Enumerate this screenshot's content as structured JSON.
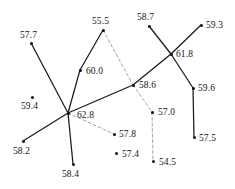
{
  "figure": {
    "type": "node-link-diagram",
    "background_color": "#ffffff",
    "line_color_solid": "#1a1a1a",
    "line_color_dashed": "#9a9a9a",
    "node_color": "#101010",
    "width": 235,
    "height": 189
  },
  "nodes": [
    {
      "id": "n57_7",
      "label": "57.7",
      "x": 31,
      "y": 43,
      "label_x": 20,
      "label_y": 30
    },
    {
      "id": "n55_5",
      "label": "55.5",
      "x": 103,
      "y": 30,
      "label_x": 92,
      "label_y": 16
    },
    {
      "id": "n58_7",
      "label": "58.7",
      "x": 149,
      "y": 26,
      "label_x": 137,
      "label_y": 12
    },
    {
      "id": "n59_3",
      "label": "59.3",
      "x": 201,
      "y": 25,
      "label_x": 206,
      "label_y": 20
    },
    {
      "id": "n60_0",
      "label": "60.0",
      "x": 80,
      "y": 70,
      "label_x": 86,
      "label_y": 66
    },
    {
      "id": "n61_8",
      "label": "61.8",
      "x": 171,
      "y": 54,
      "label_x": 176,
      "label_y": 49
    },
    {
      "id": "n58_6",
      "label": "58.6",
      "x": 133,
      "y": 85,
      "label_x": 139,
      "label_y": 80
    },
    {
      "id": "n59_6",
      "label": "59.6",
      "x": 193,
      "y": 88,
      "label_x": 198,
      "label_y": 83
    },
    {
      "id": "n59_4",
      "label": "59.4",
      "x": 32,
      "y": 97,
      "label_x": 21,
      "label_y": 101
    },
    {
      "id": "n62_8",
      "label": "62.8",
      "x": 68,
      "y": 113,
      "label_x": 77,
      "label_y": 110
    },
    {
      "id": "n57_0",
      "label": "57.0",
      "x": 152,
      "y": 112,
      "label_x": 158,
      "label_y": 107
    },
    {
      "id": "n57_5",
      "label": "57.5",
      "x": 194,
      "y": 137,
      "label_x": 199,
      "label_y": 133
    },
    {
      "id": "n57_8",
      "label": "57.8",
      "x": 114,
      "y": 134,
      "label_x": 119,
      "label_y": 129
    },
    {
      "id": "n57_4",
      "label": "57.4",
      "x": 116,
      "y": 153,
      "label_x": 122,
      "label_y": 149
    },
    {
      "id": "n54_5",
      "label": "54.5",
      "x": 153,
      "y": 161,
      "label_x": 159,
      "label_y": 157
    },
    {
      "id": "n58_2",
      "label": "58.2",
      "x": 23,
      "y": 141,
      "label_x": 13,
      "label_y": 146
    },
    {
      "id": "n58_4",
      "label": "58.4",
      "x": 73,
      "y": 164,
      "label_x": 62,
      "label_y": 169
    }
  ],
  "edges": [
    {
      "from": "n57_7",
      "to": "n62_8",
      "style": "solid"
    },
    {
      "from": "n55_5",
      "to": "n60_0",
      "style": "solid"
    },
    {
      "from": "n60_0",
      "to": "n62_8",
      "style": "solid"
    },
    {
      "from": "n62_8",
      "to": "n58_6",
      "style": "solid"
    },
    {
      "from": "n62_8",
      "to": "n58_2",
      "style": "solid"
    },
    {
      "from": "n62_8",
      "to": "n58_4",
      "style": "solid"
    },
    {
      "from": "n58_6",
      "to": "n61_8",
      "style": "solid"
    },
    {
      "from": "n61_8",
      "to": "n59_3",
      "style": "solid"
    },
    {
      "from": "n58_7",
      "to": "n61_8",
      "style": "solid"
    },
    {
      "from": "n61_8",
      "to": "n59_6",
      "style": "solid"
    },
    {
      "from": "n59_6",
      "to": "n57_5",
      "style": "solid"
    },
    {
      "from": "n55_5",
      "to": "n58_6",
      "style": "dashed"
    },
    {
      "from": "n58_6",
      "to": "n57_0",
      "style": "dashed"
    },
    {
      "from": "n57_0",
      "to": "n54_5",
      "style": "dashed"
    },
    {
      "from": "n62_8",
      "to": "n57_8",
      "style": "dashed"
    }
  ]
}
